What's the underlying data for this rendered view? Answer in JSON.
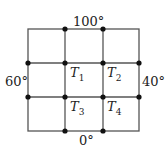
{
  "labels": {
    "top": "100°",
    "bottom": "0°",
    "left": "60°",
    "right": "40°"
  },
  "nodes": [
    {
      "name": "T",
      "sub": "1"
    },
    {
      "name": "T",
      "sub": "2"
    },
    {
      "name": "T",
      "sub": "3"
    },
    {
      "name": "T",
      "sub": "4"
    }
  ],
  "colors": {
    "line": "#555555",
    "dot": "#111111",
    "text": "#222222"
  }
}
